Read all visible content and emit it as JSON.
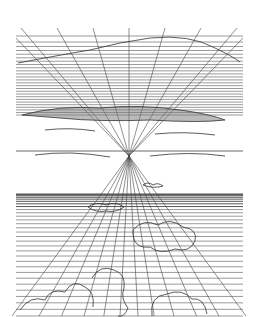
{
  "figure": {
    "title": "",
    "colors": {
      "background": "#ffffff",
      "ink": "#3a3a3a",
      "band": "#8a8a8a"
    },
    "vanishing_point": [
      129,
      156
    ],
    "frame": {
      "left": 16,
      "right": 243,
      "top": 28,
      "bottom": 316
    }
  }
}
